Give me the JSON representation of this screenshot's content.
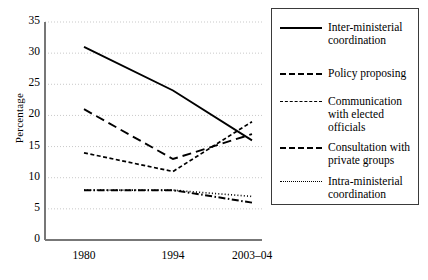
{
  "chart_data": {
    "type": "line",
    "title": "",
    "xlabel": "",
    "ylabel": "Percentage",
    "categories": [
      "1980",
      "1994",
      "2003–04"
    ],
    "ylim": [
      0,
      35
    ],
    "yticks": [
      "0",
      "5",
      "10",
      "15",
      "20",
      "25",
      "30",
      "35"
    ],
    "grid": "horizontal-dotted",
    "legend_position": "right",
    "series": [
      {
        "name": "Inter-ministerial coordination",
        "style": "solid",
        "values": [
          31,
          24,
          16
        ]
      },
      {
        "name": "Policy proposing",
        "style": "long-dash",
        "values": [
          21,
          13,
          17
        ]
      },
      {
        "name": "Communication with elected officials",
        "style": "short-dash",
        "values": [
          14,
          11,
          19
        ]
      },
      {
        "name": "Consultation with private groups",
        "style": "dash-dot",
        "values": [
          8,
          8,
          6
        ]
      },
      {
        "name": "Intra-ministerial coordination",
        "style": "dotted",
        "values": [
          8,
          8,
          7
        ]
      }
    ]
  },
  "legend": {
    "entries": [
      {
        "label_line1": "Inter-ministerial",
        "label_line2": "coordination",
        "style": "solid"
      },
      {
        "label_line1": "Policy proposing",
        "label_line2": "",
        "style": "long-dash"
      },
      {
        "label_line1": "Communication",
        "label_line2": "with elected",
        "label_line3": "officials",
        "style": "short-dash"
      },
      {
        "label_line1": "Consultation with",
        "label_line2": "private groups",
        "style": "dash-dot"
      },
      {
        "label_line1": "Intra-ministerial",
        "label_line2": "coordination",
        "style": "dotted"
      }
    ]
  }
}
